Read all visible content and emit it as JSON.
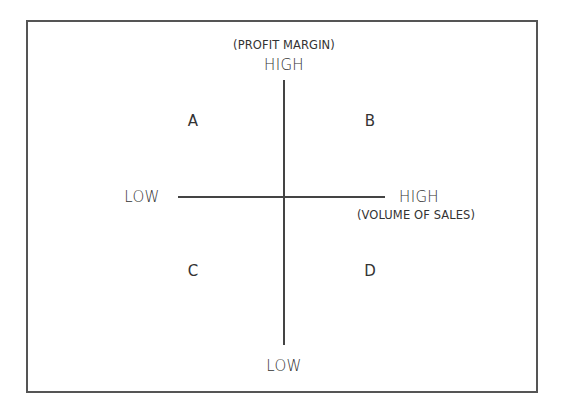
{
  "diagram": {
    "type": "quadrant-matrix",
    "y_axis": {
      "name": "(PROFIT MARGIN)",
      "high_label": "HIGH",
      "low_label": "LOW"
    },
    "x_axis": {
      "name": "(VOLUME OF SALES)",
      "high_label": "HIGH",
      "low_label": "LOW"
    },
    "quadrants": [
      {
        "id": "A",
        "label": "A",
        "position": "top-left",
        "profit_margin": "high",
        "volume_of_sales": "low"
      },
      {
        "id": "B",
        "label": "B",
        "position": "top-right",
        "profit_margin": "high",
        "volume_of_sales": "high"
      },
      {
        "id": "C",
        "label": "C",
        "position": "bottom-left",
        "profit_margin": "low",
        "volume_of_sales": "low"
      },
      {
        "id": "D",
        "label": "D",
        "position": "bottom-right",
        "profit_margin": "low",
        "volume_of_sales": "high"
      }
    ],
    "colors": {
      "line": "#444444",
      "text": "#333333",
      "border": "#555555",
      "background": "#ffffff"
    }
  }
}
